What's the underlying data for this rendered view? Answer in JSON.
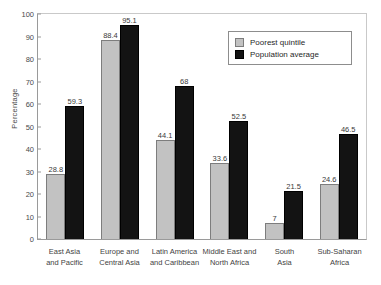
{
  "chart_data": {
    "type": "bar",
    "title": "",
    "xlabel": "",
    "ylabel": "Percentage",
    "ylim": [
      0,
      100
    ],
    "yticks": [
      100,
      90,
      80,
      70,
      60,
      50,
      40,
      30,
      20,
      10,
      0
    ],
    "grid": false,
    "legend_position": "top-right",
    "categories": [
      "East Asia and Pacific",
      "Europe and Central Asia",
      "Latin America and Caribbean",
      "Middle East and North Africa",
      "South Asia",
      "Sub-Saharan Africa"
    ],
    "category_lines": [
      [
        "East Asia",
        "and Pacific"
      ],
      [
        "Europe and",
        "Central Asia"
      ],
      [
        "Latin America",
        "and Caribbean"
      ],
      [
        "Middle East and",
        "North Africa"
      ],
      [
        "South",
        "Asia"
      ],
      [
        "Sub-Saharan",
        "Africa"
      ]
    ],
    "series": [
      {
        "name": "Poorest quintile",
        "color": "#c2c2c2",
        "values": [
          28.8,
          88.4,
          44.1,
          33.6,
          7,
          24.6
        ],
        "labels": [
          "28.8",
          "88.4",
          "44.1",
          "33.6",
          "7",
          "24.6"
        ]
      },
      {
        "name": "Population average",
        "color": "#131313",
        "values": [
          59.3,
          95.1,
          68,
          52.5,
          21.5,
          46.5
        ],
        "labels": [
          "59.3",
          "95.1",
          "68",
          "52.5",
          "21.5",
          "46.5"
        ]
      }
    ]
  }
}
